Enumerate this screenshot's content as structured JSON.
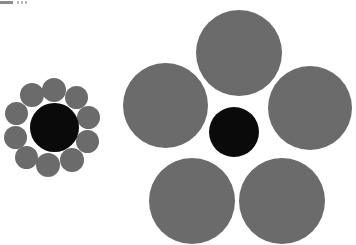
{
  "figure": {
    "name": "ebbinghaus-illusion",
    "background_color": "#ffffff",
    "width": 356,
    "height": 245
  },
  "colors": {
    "inducer_gray": "#6b6b6b",
    "target_black": "#0a0a0a",
    "background": "#ffffff",
    "artifact_bar": "#8a8a8a",
    "artifact_tick": "#b9b9b9"
  },
  "artifact": {
    "bar_label": "",
    "tick_label": ""
  },
  "left_cluster": {
    "label": "small-inducers-cluster",
    "target": {
      "cx": 54,
      "cy": 127,
      "d": 49,
      "color": "#0a0a0a"
    },
    "inducers": [
      {
        "cx": 54,
        "cy": 90,
        "d": 24
      },
      {
        "cx": 76,
        "cy": 97,
        "d": 23
      },
      {
        "cx": 88,
        "cy": 117,
        "d": 23
      },
      {
        "cx": 87,
        "cy": 141,
        "d": 23
      },
      {
        "cx": 72,
        "cy": 160,
        "d": 24
      },
      {
        "cx": 48,
        "cy": 165,
        "d": 24
      },
      {
        "cx": 26,
        "cy": 157,
        "d": 23
      },
      {
        "cx": 15,
        "cy": 137,
        "d": 23
      },
      {
        "cx": 16,
        "cy": 113,
        "d": 23
      },
      {
        "cx": 32,
        "cy": 95,
        "d": 24
      }
    ]
  },
  "right_cluster": {
    "label": "large-inducers-cluster",
    "target": {
      "cx": 234,
      "cy": 132,
      "d": 50,
      "color": "#0a0a0a"
    },
    "inducers": [
      {
        "cx": 239,
        "cy": 53,
        "d": 86
      },
      {
        "cx": 310,
        "cy": 108,
        "d": 84
      },
      {
        "cx": 282,
        "cy": 201,
        "d": 86
      },
      {
        "cx": 192,
        "cy": 201,
        "d": 86
      },
      {
        "cx": 165,
        "cy": 105,
        "d": 85
      }
    ]
  },
  "chart_data": {
    "type": "scatter",
    "xlabel": "",
    "ylabel": "",
    "xlim": [
      0,
      356
    ],
    "ylim": [
      0,
      245
    ],
    "grid": false,
    "legend": "none",
    "annotations": [
      "Two identical black target circles appear different in size.",
      "Left target is surrounded by 10 small gray inducer circles.",
      "Right target is surrounded by 5 large gray inducer circles."
    ],
    "series": [
      {
        "name": "left-target",
        "role": "target",
        "color": "#0a0a0a",
        "points": [
          {
            "x": 54,
            "y": 127,
            "diameter": 49
          }
        ]
      },
      {
        "name": "left-inducers",
        "role": "inducer",
        "color": "#6b6b6b",
        "count": 10,
        "points": [
          {
            "x": 54,
            "y": 90,
            "diameter": 24
          },
          {
            "x": 76,
            "y": 97,
            "diameter": 23
          },
          {
            "x": 88,
            "y": 117,
            "diameter": 23
          },
          {
            "x": 87,
            "y": 141,
            "diameter": 23
          },
          {
            "x": 72,
            "y": 160,
            "diameter": 24
          },
          {
            "x": 48,
            "y": 165,
            "diameter": 24
          },
          {
            "x": 26,
            "y": 157,
            "diameter": 23
          },
          {
            "x": 15,
            "y": 137,
            "diameter": 23
          },
          {
            "x": 16,
            "y": 113,
            "diameter": 23
          },
          {
            "x": 32,
            "y": 95,
            "diameter": 24
          }
        ]
      },
      {
        "name": "right-target",
        "role": "target",
        "color": "#0a0a0a",
        "points": [
          {
            "x": 234,
            "y": 132,
            "diameter": 50
          }
        ]
      },
      {
        "name": "right-inducers",
        "role": "inducer",
        "color": "#6b6b6b",
        "count": 5,
        "points": [
          {
            "x": 239,
            "y": 53,
            "diameter": 86
          },
          {
            "x": 310,
            "y": 108,
            "diameter": 84
          },
          {
            "x": 282,
            "y": 201,
            "diameter": 86
          },
          {
            "x": 192,
            "y": 201,
            "diameter": 86
          },
          {
            "x": 165,
            "y": 105,
            "diameter": 85
          }
        ]
      }
    ]
  }
}
